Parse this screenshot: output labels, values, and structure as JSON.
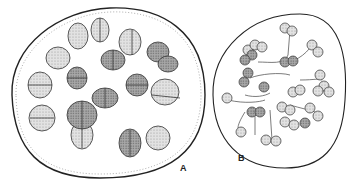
{
  "figure": {
    "panels": [
      {
        "id": "A",
        "label": "A",
        "description": "large oval colony with paired/quartet cell groups around a ring"
      },
      {
        "id": "B",
        "label": "B",
        "description": "smaller oval colony with clusters of spherical cells on branching stalks"
      }
    ],
    "colors": {
      "outline": "#222222",
      "cell_light": "#d9d9d9",
      "cell_dark": "#8f8f8f",
      "background": "#ffffff"
    }
  }
}
